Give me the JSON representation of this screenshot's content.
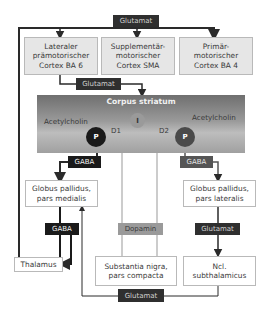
{
  "diagram": {
    "nodes": {
      "cortex_lateral": "Lateraler prämotorischer Cortex BA 6",
      "cortex_lateral_lines": [
        "Lateraler",
        "prämotorischer",
        "Cortex BA 6"
      ],
      "cortex_sma_lines": [
        "Supplementär-",
        "motorischer",
        "Cortex SMA"
      ],
      "cortex_primary_lines": [
        "Primär-",
        "motorischer",
        "Cortex BA 4"
      ],
      "striatum": "Corpus striatum",
      "acetylcholin_left": "Acetylcholin",
      "acetylcholin_right": "Acetylcholin",
      "interneuron": "I",
      "projection_left": "P",
      "projection_right": "P",
      "d1": "D1",
      "d2": "D2",
      "gp_medialis_lines": [
        "Globus pallidus,",
        "pars medialis"
      ],
      "gp_lateralis_lines": [
        "Globus pallidus,",
        "pars lateralis"
      ],
      "thalamus": "Thalamus",
      "substantia_nigra_lines": [
        "Substantia nigra,",
        "pars compacta"
      ],
      "subthalamicus_lines": [
        "Ncl.",
        "subthalamicus"
      ]
    },
    "transmitters": {
      "top": "Glutamat",
      "cortex_to_striatum": "Glutamat",
      "gaba_left": "GABA",
      "gaba_right": "GABA",
      "gaba_lower": "GABA",
      "dopamin": "Dopamin",
      "glutamat_right": "Glutamat",
      "glutamat_bottom": "Glutamat"
    },
    "colors": {
      "dark_label": "#2f2f2f",
      "black_label": "#1a1a1a",
      "mid_label": "#555555",
      "light_label": "#9a9a9a",
      "box_grey": "#e6e6e6",
      "line_dark": "#2a2a2a",
      "line_light": "#9a9a9a"
    }
  }
}
